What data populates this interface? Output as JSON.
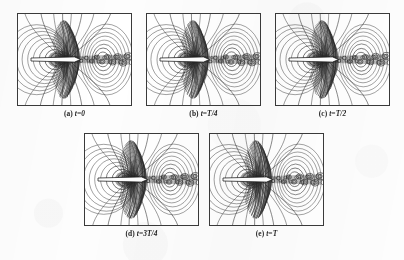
{
  "figure": {
    "background_color": "#fdfdfd",
    "frame_color": "#3a3a3a",
    "ink_color": "#262626",
    "panel_count": 5,
    "rows": [
      3,
      2
    ]
  },
  "panels": [
    {
      "id": "a",
      "caption": "(a) t=0",
      "caption_label": "(a)",
      "caption_math": "t=0",
      "time_value": "0",
      "x": 17,
      "y": 13,
      "w": 115,
      "h": 93,
      "seed": 11
    },
    {
      "id": "b",
      "caption": "(b) t=T/4",
      "caption_label": "(b)",
      "caption_math": "t=T/4",
      "time_value": "T/4",
      "x": 146,
      "y": 13,
      "w": 115,
      "h": 93,
      "seed": 23
    },
    {
      "id": "c",
      "caption": "(c) t=T/2",
      "caption_label": "(c)",
      "caption_math": "t=T/2",
      "time_value": "T/2",
      "x": 275,
      "y": 13,
      "w": 115,
      "h": 93,
      "seed": 37
    },
    {
      "id": "d",
      "caption": "(d) t=3T/4",
      "caption_label": "(d)",
      "caption_math": "t=3T/4",
      "time_value": "3T/4",
      "x": 84,
      "y": 133,
      "w": 115,
      "h": 93,
      "seed": 53
    },
    {
      "id": "e",
      "caption": "(e) t=T",
      "caption_label": "(e)",
      "caption_math": "t=T",
      "time_value": "T",
      "x": 209,
      "y": 133,
      "w": 115,
      "h": 93,
      "seed": 71
    }
  ],
  "chart_data": {
    "type": "contour",
    "title": "",
    "xlabel": "",
    "ylabel": "",
    "grid": false,
    "legend": false,
    "axis_ticks": false,
    "panel_series": [
      "(a) t=0",
      "(b) t=T/4",
      "(c) t=T/2",
      "(d) t=3T/4",
      "(e) t=T"
    ],
    "features": {
      "body": "thin horizontal white plate/arrow along the mid-height, spanning roughly the left-center to center of each panel",
      "near_field": "dense bundle of nearly vertical contour lines crowding around the plate's leading region, darkest immediately left and below of center",
      "left_lobe": "family of nested closed oval contours on the left side of the plate",
      "right_lobe": "family of nested closed oval contours on the right side of the panel",
      "wake": "chain of small closed circular contours (vortex street) trailing horizontally to the right edge",
      "outer_lines": "several long open contour lines sweeping from the top edge down past the core to the bottom edge"
    },
    "contour_levels": 14,
    "wake_vortices": 11,
    "xlim": [
      -1,
      1
    ],
    "ylim": [
      -1,
      1
    ]
  }
}
